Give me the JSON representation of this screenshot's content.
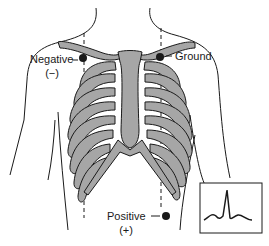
{
  "figure": {
    "colors": {
      "bone_fill": "#a6a6a6",
      "outline": "#1a1a1a",
      "electrode": "#1a1a1a",
      "background": "#ffffff"
    }
  },
  "electrodes": [
    {
      "id": "negative",
      "label": "Negative",
      "polarity": "(−)"
    },
    {
      "id": "ground",
      "label": "Ground"
    },
    {
      "id": "positive",
      "label": "Positive",
      "polarity": "(+)"
    }
  ],
  "inset": {
    "name": "ECG waveform",
    "waveform": "P-QRS-T complex"
  }
}
